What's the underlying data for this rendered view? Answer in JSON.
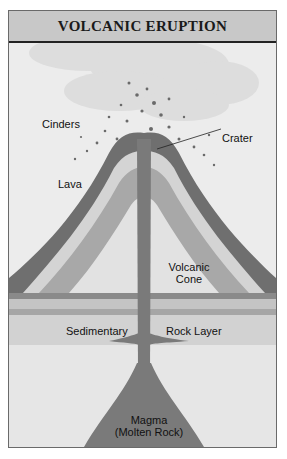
{
  "title": "VOLCANIC ERUPTION",
  "labels": {
    "cinders": "Cinders",
    "crater": "Crater",
    "lava": "Lava",
    "volcanic": "Volcanic",
    "cone": "Cone",
    "sedimentary": "Sedimentary",
    "rock_layer": "Rock Layer",
    "magma": "Magma",
    "molten_rock": "(Molten Rock)"
  },
  "colors": {
    "header_bg": "#c8c8c8",
    "lava_layer": "#6f6f6f",
    "cone_band_light": "#d4d4d4",
    "cone_band_mid": "#a8a8a8",
    "conduit": "#7a7a7a",
    "sediment": "#bdbdbd",
    "sky": "#ececec"
  }
}
